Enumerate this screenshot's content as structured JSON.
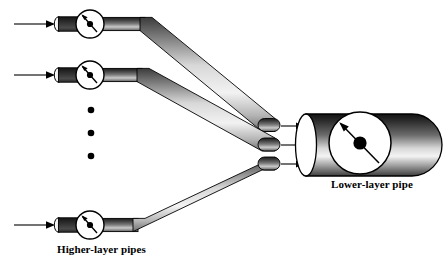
{
  "figure": {
    "type": "schematic-diagram",
    "background_color": "#ffffff",
    "stroke_color": "#000000"
  },
  "labels": {
    "higher_layer": "Higher-layer pipes",
    "lower_layer": "Lower-layer pipe"
  },
  "colors": {
    "pipe_dark": "#2b2b2b",
    "pipe_mid": "#6e6e6e",
    "pipe_light": "#f0f0f0",
    "outline": "#000000",
    "gauge_face": "#ffffff",
    "needle": "#000000"
  },
  "higher_layer_pipes": [
    {
      "id": "pipe-1",
      "inlet_arrow": true,
      "gauge": "valve-gauge-icon",
      "needle_direction": "up-left",
      "row_y": 24
    },
    {
      "id": "pipe-2",
      "inlet_arrow": true,
      "gauge": "valve-gauge-icon",
      "needle_direction": "up-left",
      "row_y": 75
    },
    {
      "id": "pipe-3",
      "inlet_arrow": true,
      "gauge": "valve-gauge-icon",
      "needle_direction": "up-left",
      "row_y": 225
    }
  ],
  "ellipsis": {
    "icon": "vertical-ellipsis-icon",
    "dot_count": 3,
    "x": 91,
    "dot_y": [
      110,
      133,
      156
    ]
  },
  "lower_layer_pipe": {
    "id": "pipe-lower",
    "gauge": "valve-gauge-icon",
    "needle_direction": "up-left-to-down-right",
    "inlet_arrow_count": 3,
    "left_x": 292,
    "right_x": 432,
    "center_y": 145
  },
  "junction": {
    "inflow_arrows": [
      {
        "y": 126
      },
      {
        "y": 145
      },
      {
        "y": 164
      }
    ]
  }
}
